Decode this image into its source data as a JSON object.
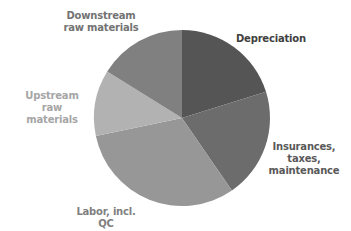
{
  "chart_data": {
    "type": "pie",
    "title": "",
    "start_angle_deg": 0,
    "direction": "clockwise",
    "categories": [
      "Depreciation",
      "Insurances, taxes, maintenance",
      "Labor, incl. QC",
      "Upstream raw materials",
      "Downstream raw materials"
    ],
    "values": [
      20,
      20,
      31,
      12,
      16
    ],
    "colors": [
      "#555555",
      "#6c6c6c",
      "#979797",
      "#b2b2b2",
      "#808080"
    ],
    "legend": "none (data labels outside slices)",
    "labels": [
      {
        "text": "Depreciation",
        "color": "#404040"
      },
      {
        "text": "Insurances,\ntaxes,\nmaintenance",
        "color": "#595959"
      },
      {
        "text": "Labor, incl. QC",
        "color": "#7f7f7f"
      },
      {
        "text": "Upstream raw\nmaterials",
        "color": "#a6a6a6"
      },
      {
        "text": "Downstream\nraw materials",
        "color": "#737373"
      }
    ]
  }
}
